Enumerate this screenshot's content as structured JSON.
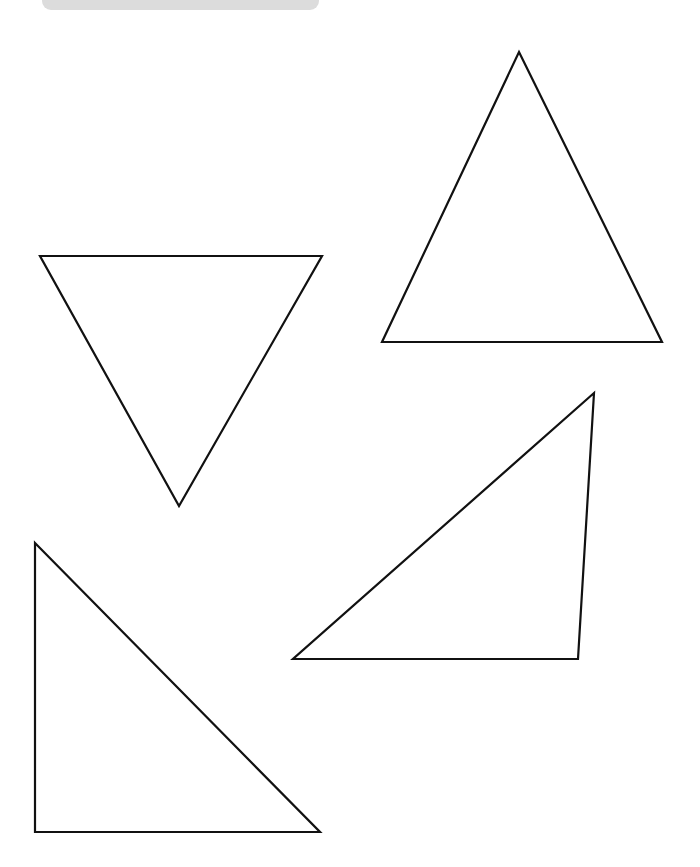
{
  "page": {
    "width": 700,
    "height": 867,
    "background_color": "#ffffff"
  },
  "top_banner": {
    "name": "header-banner",
    "color": "#dcdcdc",
    "x": 42,
    "y": -16,
    "width": 277,
    "height": 26,
    "corner_radius": 9,
    "label": ""
  },
  "drawing": {
    "stroke_color": "#111111",
    "fill_color": "#ffffff",
    "stroke_width": 2.2,
    "shape_count_label": "4",
    "shapes": [
      {
        "id": "triangle-inverted-top-left",
        "kind": "triangle",
        "orientation": "inverted",
        "description": "Downward-pointing triangle, upper left",
        "points": "40,256 322,256 179,506"
      },
      {
        "id": "triangle-upright-top-right",
        "kind": "triangle",
        "orientation": "upright",
        "description": "Upward-pointing triangle, upper right",
        "points": "519,52 662,342 382,342"
      },
      {
        "id": "triangle-right-middle-right",
        "kind": "triangle",
        "orientation": "right-angle",
        "description": "Right triangle with vertical right leg, middle right",
        "points": "594,393 578,659 293,659"
      },
      {
        "id": "triangle-right-bottom-left",
        "kind": "triangle",
        "orientation": "right-angle",
        "description": "Right triangle with vertical left leg, bottom left",
        "points": "35,543 320,832 35,832"
      }
    ]
  }
}
